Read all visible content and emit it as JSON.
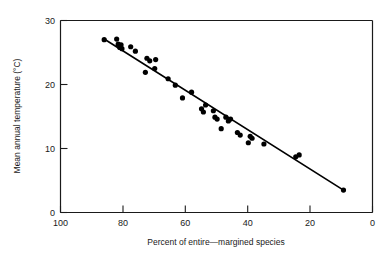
{
  "chart_data": {
    "type": "scatter",
    "title": "",
    "xlabel": "Percent of entire—margined species",
    "ylabel": "Mean annual temperature (°C)",
    "xlim": [
      100,
      0
    ],
    "ylim": [
      0,
      30
    ],
    "x_ticks": [
      100,
      80,
      60,
      40,
      20,
      0
    ],
    "x_tick_labels": [
      "100",
      "80",
      "60",
      "40",
      "20",
      "0"
    ],
    "y_ticks": [
      0,
      10,
      20,
      30
    ],
    "y_tick_labels": [
      "0",
      "10",
      "20",
      "30"
    ],
    "grid": false,
    "legend": null,
    "x_axis_inverted": true,
    "marker": "filled-circle",
    "marker_color": "#000000",
    "points": [
      {
        "x": 86.0,
        "y": 27.0
      },
      {
        "x": 82.0,
        "y": 27.1
      },
      {
        "x": 81.5,
        "y": 26.3
      },
      {
        "x": 81.0,
        "y": 25.8
      },
      {
        "x": 80.6,
        "y": 26.2
      },
      {
        "x": 80.3,
        "y": 25.6
      },
      {
        "x": 77.5,
        "y": 25.9
      },
      {
        "x": 76.0,
        "y": 25.2
      },
      {
        "x": 72.3,
        "y": 24.1
      },
      {
        "x": 71.4,
        "y": 23.7
      },
      {
        "x": 69.5,
        "y": 23.9
      },
      {
        "x": 72.8,
        "y": 21.9
      },
      {
        "x": 69.8,
        "y": 22.5
      },
      {
        "x": 65.5,
        "y": 20.9
      },
      {
        "x": 63.2,
        "y": 19.9
      },
      {
        "x": 60.9,
        "y": 17.9
      },
      {
        "x": 58.0,
        "y": 18.8
      },
      {
        "x": 53.5,
        "y": 16.8
      },
      {
        "x": 54.8,
        "y": 16.2
      },
      {
        "x": 54.2,
        "y": 15.7
      },
      {
        "x": 51.0,
        "y": 15.9
      },
      {
        "x": 50.5,
        "y": 14.9
      },
      {
        "x": 49.8,
        "y": 14.6
      },
      {
        "x": 47.0,
        "y": 14.9
      },
      {
        "x": 46.2,
        "y": 14.3
      },
      {
        "x": 45.5,
        "y": 14.6
      },
      {
        "x": 48.5,
        "y": 13.1
      },
      {
        "x": 43.3,
        "y": 12.5
      },
      {
        "x": 42.4,
        "y": 12.1
      },
      {
        "x": 39.2,
        "y": 11.9
      },
      {
        "x": 38.6,
        "y": 11.6
      },
      {
        "x": 39.8,
        "y": 10.9
      },
      {
        "x": 34.8,
        "y": 10.7
      },
      {
        "x": 23.5,
        "y": 9.0
      },
      {
        "x": 24.6,
        "y": 8.7
      },
      {
        "x": 9.3,
        "y": 3.5
      }
    ],
    "trend_line": {
      "type": "linear-fit",
      "x_start": 86.0,
      "y_start": 27.1,
      "x_end": 9.3,
      "y_end": 3.5
    }
  }
}
